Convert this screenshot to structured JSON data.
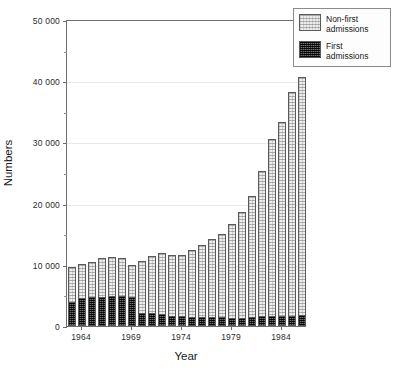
{
  "chart_data": {
    "type": "bar",
    "stacked": true,
    "title": "",
    "xlabel": "Year",
    "ylabel": "Numbers",
    "ylim": [
      0,
      50000
    ],
    "ytick_values": [
      0,
      10000,
      20000,
      30000,
      40000,
      50000
    ],
    "ytick_labels": [
      "0",
      "10 000",
      "20 000",
      "30 000",
      "40 000",
      "50 000"
    ],
    "yminor_values": [
      5000,
      15000,
      25000,
      35000,
      45000
    ],
    "grid": "horizontal",
    "xtick_labels": [
      "1964",
      "1969",
      "1974",
      "1979",
      "1984"
    ],
    "xtick_years": [
      1964,
      1969,
      1974,
      1979,
      1984
    ],
    "categories": [
      1963,
      1964,
      1965,
      1966,
      1967,
      1968,
      1969,
      1970,
      1971,
      1972,
      1973,
      1974,
      1975,
      1976,
      1977,
      1978,
      1979,
      1980,
      1981,
      1982,
      1983,
      1984,
      1985,
      1986
    ],
    "series": [
      {
        "name": "First admissions",
        "color": "#3a3a3a",
        "pattern": "dense-dark",
        "values": [
          4000,
          4500,
          4700,
          4800,
          4900,
          4900,
          4700,
          2100,
          2200,
          2000,
          1600,
          1700,
          1500,
          1500,
          1400,
          1400,
          1300,
          1300,
          1500,
          1600,
          1600,
          1700,
          1700,
          1800
        ]
      },
      {
        "name": "Non-first admissions",
        "color": "#ededed",
        "pattern": "light-hatch",
        "values": [
          5600,
          5700,
          5800,
          6300,
          6300,
          6200,
          5300,
          8500,
          9200,
          9900,
          10000,
          9900,
          11000,
          11800,
          12800,
          13600,
          15300,
          17300,
          19800,
          23800,
          28900,
          31700,
          36600,
          38900
        ]
      }
    ],
    "totals": [
      9600,
      10200,
      10500,
      11100,
      11200,
      11100,
      10000,
      10600,
      11400,
      11900,
      11600,
      11600,
      12500,
      13300,
      14200,
      15000,
      16600,
      18600,
      21300,
      25400,
      30500,
      33400,
      38300,
      40700
    ]
  },
  "legend": {
    "position": "top-right",
    "entries": [
      {
        "label": "Non-first admissions",
        "swatch": "light-hatch-swatch"
      },
      {
        "label": "First admissions",
        "swatch": "dark-swatch"
      }
    ]
  }
}
